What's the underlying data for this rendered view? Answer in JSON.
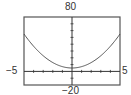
{
  "chart_data": {
    "type": "line",
    "title": "",
    "xlabel": "",
    "ylabel": "",
    "xlim": [
      -5,
      5
    ],
    "ylim": [
      -20,
      80
    ],
    "xscale": 1,
    "yscale": 10,
    "grid": false,
    "tick_labels": {
      "xmin": "−5",
      "xmax": "5",
      "ymin": "−20",
      "ymax": "80"
    },
    "series": [
      {
        "name": "curve",
        "function": "y = 2x^2 + 5",
        "x": [
          -5,
          -4,
          -3,
          -2,
          -1,
          0,
          1,
          2,
          3,
          4,
          5
        ],
        "y": [
          55,
          37,
          23,
          13,
          7,
          5,
          7,
          13,
          23,
          37,
          55
        ]
      }
    ],
    "colors": {
      "frame": "#555555",
      "curve": "#444444",
      "axis": "#333333"
    }
  }
}
